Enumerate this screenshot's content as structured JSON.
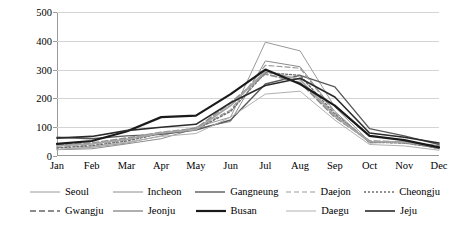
{
  "chart_data": {
    "type": "line",
    "title": "",
    "xlabel": "",
    "ylabel": "Precipitation (mm)",
    "categories": [
      "Jan",
      "Feb",
      "Mar",
      "Apr",
      "May",
      "Jun",
      "Jul",
      "Aug",
      "Sep",
      "Oct",
      "Nov",
      "Dec"
    ],
    "yticks": [
      0,
      100,
      200,
      300,
      400,
      500
    ],
    "ylim": [
      0,
      500
    ],
    "grid": true,
    "legend_position": "bottom",
    "series": [
      {
        "name": "Seoul",
        "color": "#9a9a9a",
        "dash": "none",
        "width": 1.0,
        "values": [
          22,
          30,
          45,
          70,
          100,
          135,
          395,
          365,
          170,
          50,
          50,
          25
        ]
      },
      {
        "name": "Incheon",
        "color": "#8c8c8c",
        "dash": "none",
        "width": 1.0,
        "values": [
          22,
          25,
          42,
          60,
          95,
          120,
          330,
          310,
          155,
          45,
          50,
          25
        ]
      },
      {
        "name": "Gangneung",
        "color": "#5a5a5a",
        "dash": "none",
        "width": 1.4,
        "values": [
          65,
          60,
          70,
          75,
          90,
          125,
          250,
          280,
          240,
          95,
          70,
          40
        ]
      },
      {
        "name": "Daejon",
        "color": "#9a9a9a",
        "dash": "5,3",
        "width": 1.2,
        "values": [
          30,
          38,
          55,
          80,
          95,
          160,
          315,
          305,
          150,
          50,
          45,
          30
        ]
      },
      {
        "name": "Cheongju",
        "color": "#6e6e6e",
        "dash": "2,2",
        "width": 1.4,
        "values": [
          28,
          35,
          52,
          78,
          92,
          155,
          290,
          280,
          145,
          48,
          45,
          28
        ]
      },
      {
        "name": "Gwangju",
        "color": "#8c8c8c",
        "dash": "6,3",
        "width": 1.8,
        "values": [
          38,
          45,
          62,
          82,
          95,
          185,
          285,
          255,
          135,
          52,
          48,
          35
        ]
      },
      {
        "name": "Jeonju",
        "color": "#a6a6a6",
        "dash": "none",
        "width": 1.8,
        "values": [
          35,
          42,
          58,
          80,
          92,
          175,
          295,
          265,
          140,
          50,
          48,
          32
        ]
      },
      {
        "name": "Busan",
        "color": "#1a1a1a",
        "dash": "none",
        "width": 2.2,
        "values": [
          42,
          52,
          85,
          135,
          140,
          215,
          300,
          250,
          175,
          70,
          55,
          30
        ]
      },
      {
        "name": "Daegu",
        "color": "#b0b0b0",
        "dash": "none",
        "width": 1.0,
        "values": [
          22,
          32,
          48,
          68,
          78,
          135,
          215,
          225,
          125,
          40,
          35,
          20
        ]
      },
      {
        "name": "Jeju",
        "color": "#2b2b2b",
        "dash": "none",
        "width": 1.6,
        "values": [
          62,
          68,
          88,
          100,
          110,
          185,
          245,
          270,
          205,
          80,
          65,
          45
        ]
      }
    ]
  }
}
